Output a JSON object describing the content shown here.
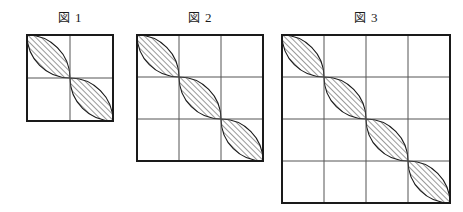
{
  "page": {
    "background_color": "#ffffff",
    "ink_color": "#1a1a1a",
    "grid_line_color": "#555555",
    "border_color": "#1a1a1a",
    "hatch_color": "#333333"
  },
  "figures": [
    {
      "id": "figure-1",
      "caption": "図 1",
      "caption_kanji": "図",
      "caption_number": "1",
      "grid_n": 2,
      "cell_px": 43,
      "square_px": 86,
      "left": 27,
      "top": 35,
      "caption_top": 11,
      "lens_count": 2,
      "description": "2 by 2 grid with a chain of 2 hatched lens shapes along the anti-diagonal"
    },
    {
      "id": "figure-2",
      "caption": "図 2",
      "caption_kanji": "図",
      "caption_number": "2",
      "grid_n": 3,
      "cell_px": 42,
      "square_px": 126,
      "left": 137,
      "top": 35,
      "caption_top": 11,
      "lens_count": 3,
      "description": "3 by 3 grid with a chain of 3 hatched lens shapes along the anti-diagonal"
    },
    {
      "id": "figure-3",
      "caption": "図 3",
      "caption_kanji": "図",
      "caption_number": "3",
      "grid_n": 4,
      "cell_px": 42,
      "square_px": 168,
      "left": 282,
      "top": 35,
      "caption_top": 11,
      "lens_count": 4,
      "description": "4 by 4 grid with a chain of 4 hatched lens shapes along the anti-diagonal"
    }
  ],
  "hatch": {
    "angle_label": "45",
    "direction": "bottom-left-to-top-right",
    "spacing_px": "4"
  }
}
